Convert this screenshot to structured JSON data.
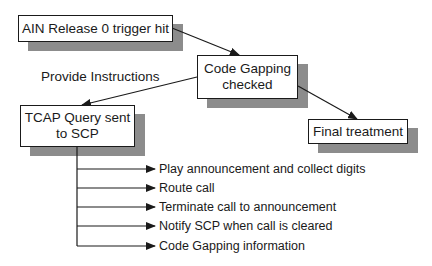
{
  "diagram": {
    "nodes": {
      "trigger": {
        "label": "AIN Release 0 trigger hit"
      },
      "code_gapping": {
        "label_line1": "Code Gapping",
        "label_line2": "checked"
      },
      "final": {
        "label": "Final treatment"
      },
      "tcap": {
        "label_line1": "TCAP Query sent",
        "label_line2": "to SCP"
      }
    },
    "edges": {
      "provide_instructions_label": "Provide Instructions"
    },
    "instructions": [
      "Play announcement and collect digits",
      "Route call",
      "Terminate call to announcement",
      "Notify SCP when call is cleared",
      "Code Gapping information"
    ],
    "colors": {
      "shadow": "#8c8c8c",
      "stroke": "#1a1a1a"
    }
  }
}
